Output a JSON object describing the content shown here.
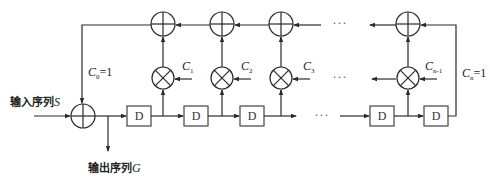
{
  "diagram": {
    "input_label": {
      "text": "输入序列",
      "var": "S"
    },
    "output_label": {
      "text": "输出序列",
      "var": "G"
    },
    "register_label": "D",
    "ellipsis": "···",
    "left_coef": {
      "base": "C",
      "sub": "0",
      "suffix": "=1"
    },
    "right_coef": {
      "base": "C",
      "sub": "n",
      "suffix": "=1"
    },
    "coefficients": [
      {
        "base": "C",
        "sub": "1"
      },
      {
        "base": "C",
        "sub": "2"
      },
      {
        "base": "C",
        "sub": "3"
      },
      {
        "base": "C",
        "sub": "n-1"
      }
    ],
    "nodes": {
      "adder_symbol": "xor",
      "multiplier_symbol": "multiply"
    }
  }
}
